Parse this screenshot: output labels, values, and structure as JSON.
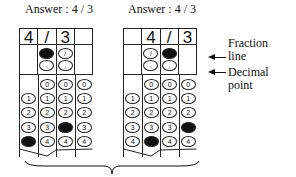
{
  "grids": [
    {
      "title": "Answer : 4 / 3",
      "header": [
        "4",
        "/",
        "3",
        ""
      ],
      "ops": [
        {
          "slash": null,
          "dot": null
        },
        {
          "slash": "filled",
          "dot": "open"
        },
        {
          "slash": "open",
          "dot": "open"
        },
        {
          "slash": null,
          "dot": null
        }
      ],
      "digit_cols": [
        {
          "has_zero": false,
          "filled": 4
        },
        {
          "has_zero": true,
          "filled": null
        },
        {
          "has_zero": true,
          "filled": 3
        },
        {
          "has_zero": true,
          "filled": null
        }
      ]
    },
    {
      "title": "Answer : 4 / 3",
      "header": [
        "",
        "4",
        "/",
        "3"
      ],
      "ops": [
        {
          "slash": null,
          "dot": null
        },
        {
          "slash": "open",
          "dot": "open"
        },
        {
          "slash": "filled",
          "dot": "open"
        },
        {
          "slash": null,
          "dot": null
        }
      ],
      "digit_cols": [
        {
          "has_zero": false,
          "filled": null
        },
        {
          "has_zero": true,
          "filled": 4
        },
        {
          "has_zero": true,
          "filled": null
        },
        {
          "has_zero": true,
          "filled": 3
        }
      ]
    }
  ],
  "bubble_digits": [
    "0",
    "1",
    "2",
    "3",
    "4"
  ],
  "labels": {
    "fraction_line": "Fraction line",
    "fraction_line_1": "Fraction",
    "fraction_line_2": "line",
    "decimal_point_1": "Decimal",
    "decimal_point_2": "point"
  },
  "colors": {
    "ink": "#111111",
    "background": "#ffffff"
  }
}
